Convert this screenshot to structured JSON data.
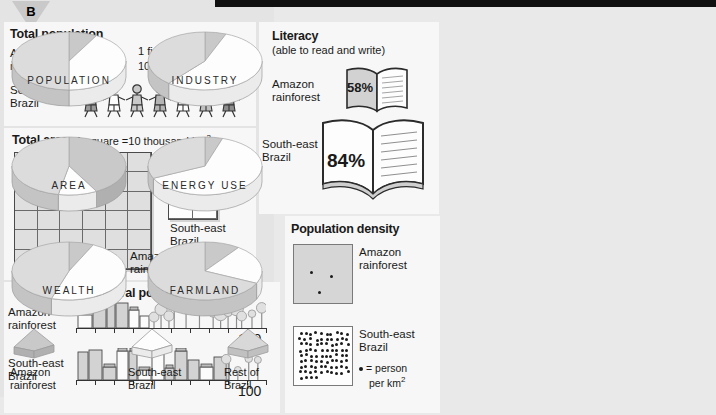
{
  "badge": {
    "letter": "B"
  },
  "panels": {
    "population": {
      "title": "Total population",
      "key_line1": "1 figure =",
      "key_line2": "10 million people",
      "rows": [
        {
          "label_line1": "Amazon",
          "label_line2": "rainforest",
          "figures": 1
        },
        {
          "label_line1": "South-east",
          "label_line2": "Brazil",
          "figures": 7
        }
      ]
    },
    "area": {
      "title": "Total area",
      "key": "1 square =10 thousand km",
      "key_sup": "2",
      "amazon": {
        "label_line1": "Amazon",
        "label_line2": "rainforest",
        "cols": 6,
        "rows": 6,
        "squares": 36
      },
      "southeast": {
        "label_line1": "South-east",
        "label_line2": "Brazil",
        "cols": 2,
        "rows": 3,
        "squares": 6
      }
    },
    "urban": {
      "title": "Urban/rural population",
      "scale_max": "100",
      "rows": [
        {
          "label_line1": "Amazon",
          "label_line2": "rainforest",
          "urban_percent": 40
        },
        {
          "label_line1": "South-east",
          "label_line2": "Brazil",
          "urban_percent": 78
        }
      ]
    },
    "literacy": {
      "title": "Literacy",
      "subtitle": "(able to read and write)",
      "rows": [
        {
          "label_line1": "Amazon",
          "label_line2": "rainforest",
          "value": "58%"
        },
        {
          "label_line1": "South-east",
          "label_line2": "Brazil",
          "value": "84%"
        }
      ]
    },
    "density": {
      "title": "Population density",
      "amazon": {
        "label_line1": "Amazon",
        "label_line2": "rainforest",
        "dots": 3
      },
      "southeast": {
        "label_line1": "South-east",
        "label_line2": "Brazil",
        "dots": 84
      },
      "key": "= person",
      "key_line2": "per km",
      "key_sup": "2"
    }
  },
  "chart_data": {
    "type": "pie",
    "legend_position": "bottom",
    "categories": [
      "Amazon rainforest",
      "South-east Brazil",
      "Rest of Brazil"
    ],
    "colors": [
      "#c9c9c9",
      "#fdfdfd",
      "#dcdcdc"
    ],
    "charts": [
      {
        "label": "POPULATION",
        "values": [
          8,
          42,
          50
        ]
      },
      {
        "label": "INDUSTRY",
        "values": [
          6,
          55,
          39
        ]
      },
      {
        "label": "AREA",
        "values": [
          42,
          11,
          47
        ]
      },
      {
        "label": "ENERGY USE",
        "values": [
          5,
          63,
          32
        ]
      },
      {
        "label": "WEALTH",
        "values": [
          7,
          48,
          45
        ]
      },
      {
        "label": "FARMLAND",
        "values": [
          10,
          22,
          68
        ]
      }
    ]
  },
  "legend": [
    {
      "label_line1": "Amazon",
      "label_line2": "rainforest",
      "color": "#c9c9c9"
    },
    {
      "label_line1": "South-east",
      "label_line2": "Brazil",
      "color": "#fdfdfd"
    },
    {
      "label_line1": "Rest of",
      "label_line2": "Brazil",
      "color": "#d8d8d8"
    }
  ]
}
